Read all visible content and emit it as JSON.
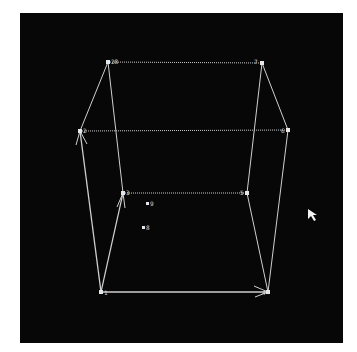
{
  "scene": {
    "background": "#070707",
    "edge_color": "#cfcfcf",
    "vertices": [
      {
        "id": "v-top-back-left",
        "x": 108,
        "y": 62,
        "label": "28"
      },
      {
        "id": "v-top-back-right",
        "x": 262,
        "y": 63,
        "label": "7"
      },
      {
        "id": "v-mid-left",
        "x": 80,
        "y": 131,
        "label": "2"
      },
      {
        "id": "v-mid-right",
        "x": 288,
        "y": 130,
        "label": "6"
      },
      {
        "id": "v-inner-left",
        "x": 123,
        "y": 193,
        "label": "3"
      },
      {
        "id": "v-inner-right",
        "x": 247,
        "y": 193,
        "label": "5"
      },
      {
        "id": "v-bottom-left",
        "x": 101,
        "y": 292,
        "label": "1"
      },
      {
        "id": "v-bottom-right",
        "x": 268,
        "y": 292,
        "label": "4"
      }
    ],
    "points": [
      {
        "id": "point-a",
        "x": 149,
        "y": 204,
        "label": "9"
      },
      {
        "id": "point-b",
        "x": 145,
        "y": 228,
        "label": "8"
      }
    ],
    "cursor": {
      "x": 308,
      "y": 209
    }
  }
}
